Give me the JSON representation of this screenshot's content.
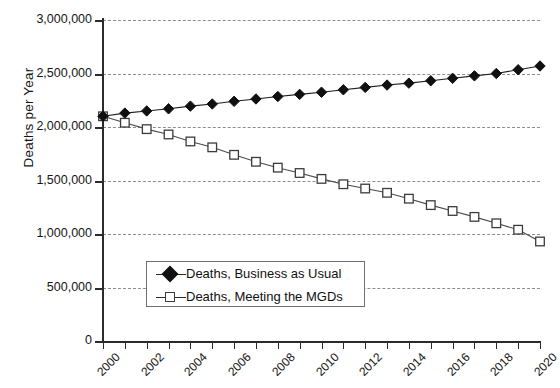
{
  "chart_data": {
    "type": "line",
    "title": "",
    "xlabel": "",
    "ylabel": "Deaths per Year",
    "xlim": [
      2000,
      2020
    ],
    "ylim": [
      0,
      3000000
    ],
    "grid": true,
    "legend_position": "inside-lower-center",
    "x": [
      2000,
      2001,
      2002,
      2003,
      2004,
      2005,
      2006,
      2007,
      2008,
      2009,
      2010,
      2011,
      2012,
      2013,
      2014,
      2015,
      2016,
      2017,
      2018,
      2019,
      2020
    ],
    "y_ticks": [
      0,
      500000,
      1000000,
      1500000,
      2000000,
      2500000,
      3000000
    ],
    "y_tick_labels": [
      "0",
      "500,000",
      "1,000,000",
      "1,500,000",
      "2,000,000",
      "2,500,000",
      "3,000,000"
    ],
    "x_tick_labels": [
      "2000",
      "2001",
      "2002",
      "2003",
      "2004",
      "2005",
      "2006",
      "2007",
      "2008",
      "2009",
      "2010",
      "2011",
      "2012",
      "2013",
      "2014",
      "2015",
      "2016",
      "2017",
      "2018",
      "2019",
      "2020"
    ],
    "x_tick_labels_shown": [
      "2000",
      "2002",
      "2004",
      "2006",
      "2008",
      "2010",
      "2012",
      "2014",
      "2016",
      "2018",
      "2020"
    ],
    "series": [
      {
        "name": "Deaths, Business as Usual",
        "marker": "filled-diamond",
        "color": "#101010",
        "values": [
          2100000,
          2130000,
          2150000,
          2170000,
          2195000,
          2215000,
          2240000,
          2262000,
          2285000,
          2305000,
          2325000,
          2348000,
          2370000,
          2392000,
          2410000,
          2432000,
          2455000,
          2478000,
          2500000,
          2535000,
          2570000
        ]
      },
      {
        "name": "Deaths, Meeting the MGDs",
        "marker": "open-square",
        "color": "#3c3c3c",
        "values": [
          2100000,
          2040000,
          1980000,
          1930000,
          1865000,
          1810000,
          1740000,
          1675000,
          1620000,
          1570000,
          1515000,
          1465000,
          1425000,
          1385000,
          1330000,
          1270000,
          1215000,
          1160000,
          1100000,
          1040000,
          930000
        ]
      }
    ]
  },
  "legend": {
    "items": [
      {
        "label": "Deaths, Business as Usual",
        "marker": "filled-diamond"
      },
      {
        "label": "Deaths, Meeting the MGDs",
        "marker": "open-square"
      }
    ]
  },
  "colors": {
    "axis": "#2b2b2b",
    "grid": "#8d8d8d",
    "series_bau": "#101010",
    "series_mgd": "#3c3c3c",
    "background": "#ffffff"
  }
}
